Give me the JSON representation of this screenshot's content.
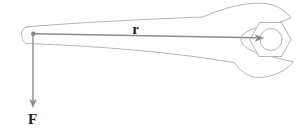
{
  "labels": {
    "r": "r",
    "F": "F"
  },
  "colors": {
    "background": "#ffffff",
    "wrench-outline": "#b5b5b5",
    "vector": "#8c8c8c",
    "label": "#1d1d1d"
  }
}
